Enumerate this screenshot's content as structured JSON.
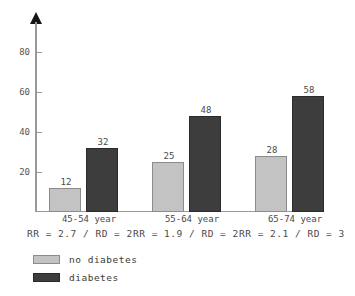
{
  "chart_data": {
    "type": "bar",
    "title": "",
    "subtitle": "",
    "xlabel": "",
    "ylabel": "",
    "ylim": [
      0,
      95
    ],
    "grid": false,
    "legend_position": "bottom-left",
    "categories": [
      "45-54 year",
      "55-64 year",
      "65-74 year"
    ],
    "yticks": [
      20,
      40,
      60,
      80
    ],
    "series": [
      {
        "name": "no diabetes",
        "color": "#c3c3c3",
        "values": [
          12,
          25,
          28
        ]
      },
      {
        "name": "diabetes",
        "color": "#3d3d3d",
        "values": [
          32,
          48,
          58
        ]
      }
    ],
    "annotations": [
      "RR = 2.7 / RD = 20",
      "RR = 1.9 / RD = 23",
      "RR = 2.1 / RD = 30"
    ],
    "annotation_note": "stats row is overlapped and clipped at right edge of figure"
  },
  "axis": {
    "tick_20": "20",
    "tick_40": "40",
    "tick_60": "60",
    "tick_80": "80"
  },
  "groups": [
    {
      "label": "45-54 year",
      "light_value": "12",
      "dark_value": "32",
      "annotation": "RR = 2.7 / RD = 20"
    },
    {
      "label": "55-64 year",
      "light_value": "25",
      "dark_value": "48",
      "annotation": "RR = 1.9 / RD = 23"
    },
    {
      "label": "65-74 year",
      "light_value": "28",
      "dark_value": "58",
      "annotation": "RR = 2.1 / RD = 30"
    }
  ],
  "legend": {
    "items": [
      {
        "label": "no diabetes",
        "color": "#c3c3c3"
      },
      {
        "label": "diabetes",
        "color": "#3d3d3d"
      }
    ]
  },
  "colors": {
    "light_bar": "#c3c3c3",
    "dark_bar": "#3d3d3d",
    "axis": "#9a9a9a",
    "text": "#4a4a4a",
    "background": "#ffffff"
  }
}
